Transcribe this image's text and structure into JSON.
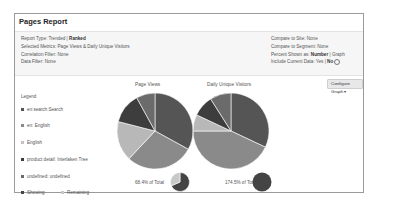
{
  "panel": {
    "title": "Pages Report"
  },
  "info": {
    "left": [
      {
        "label": "Report Type: Trended | ",
        "value": "Ranked"
      },
      {
        "label": "Selected Metrics: Page Views & Daily Unique Visitors",
        "value": ""
      },
      {
        "label": "Correlation Filter: None",
        "value": ""
      },
      {
        "label": "Data Filter: None",
        "value": ""
      }
    ],
    "right": [
      {
        "label": "Compare to Site: None",
        "value": "",
        "suffix": ""
      },
      {
        "label": "Compare to Segment: None",
        "value": "",
        "suffix": ""
      },
      {
        "label": "Percent Shown as: ",
        "value": "Number",
        "suffix": " | Graph"
      },
      {
        "label": "Include Current Data: Yes | ",
        "value": "No",
        "suffix": ""
      }
    ],
    "info_icon": "info-circle-icon"
  },
  "configure_button": {
    "label": "Configure Graph ▾"
  },
  "legend": {
    "title": "Legend",
    "items": [
      {
        "label": "en:search:Search",
        "color": "#555555"
      },
      {
        "label": "en: English",
        "color": "#8a8a8a"
      },
      {
        "label": "English",
        "color": "#c4c4c4"
      },
      {
        "label": "product detail: Interlaken Tree",
        "color": "#3d3d3d"
      },
      {
        "label": "undefined: undefined",
        "color": "#6b6b6b"
      }
    ],
    "showing_label": "Showing",
    "remaining_label": "Remaining",
    "showing_color": "#444444",
    "remaining_color": "#c8c8c8"
  },
  "chart_data": [
    {
      "type": "pie",
      "title": "Page Views",
      "categories": [
        "en:search:Search",
        "en: English",
        "English",
        "product detail: Interlaken Tree",
        "undefined: undefined"
      ],
      "values": [
        33,
        29,
        17,
        13,
        8
      ],
      "colors": [
        "#555555",
        "#8a8a8a",
        "#b8b8b8",
        "#3d3d3d",
        "#6b6b6b"
      ],
      "total_label": "68.4% of Total",
      "total_percent": 68.4
    },
    {
      "type": "pie",
      "title": "Daily Unique Visitors",
      "categories": [
        "en:search:Search",
        "en: English",
        "English",
        "product detail: Interlaken Tree",
        "undefined: undefined"
      ],
      "values": [
        32,
        43,
        7,
        9,
        9
      ],
      "colors": [
        "#555555",
        "#8a8a8a",
        "#b8b8b8",
        "#3d3d3d",
        "#6b6b6b"
      ],
      "total_label": "174.5% of Total",
      "total_percent": 100
    }
  ]
}
